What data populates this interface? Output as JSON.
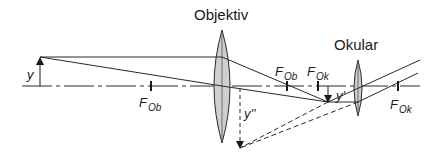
{
  "diagram": {
    "type": "microscope-ray-diagram",
    "labels": {
      "objective": "Objektiv",
      "eyepiece": "Okular",
      "object": "y",
      "intermediate_image": "y'",
      "virtual_image": "y''",
      "focal_F": "F",
      "focal_ob_sub": "Ob",
      "focal_ok_sub": "Ok"
    },
    "colors": {
      "line": "#2a2a2a",
      "lens_fill": "#cfcfcf",
      "background": "#ffffff"
    },
    "elements": {
      "optical_axis": {
        "y": 86,
        "x_start": 22,
        "x_end": 420,
        "style": "dash-dot"
      },
      "object_arrow": {
        "x": 40,
        "y_base": 86,
        "y_tip": 57
      },
      "objective_lens": {
        "cx": 222,
        "top": 30,
        "bottom": 143
      },
      "eyepiece_lens": {
        "cx": 358,
        "top": 60,
        "bottom": 116
      },
      "focal_points": [
        {
          "name": "F_Ob_front",
          "x": 151
        },
        {
          "name": "F_Ob_back",
          "x": 287
        },
        {
          "name": "F_Ok_front",
          "x": 318
        },
        {
          "name": "F_Ok_back",
          "x": 398
        }
      ],
      "intermediate_image_arrow": {
        "x": 328,
        "y_base": 86,
        "y_tip": 102
      },
      "virtual_image_arrow": {
        "x": 240,
        "y_base": 86,
        "y_tip": 148
      }
    }
  }
}
